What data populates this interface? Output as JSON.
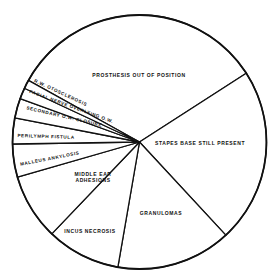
{
  "chart_data": {
    "type": "pie",
    "title": "",
    "center": [
      139.5,
      142
    ],
    "radius": 127,
    "start_angle_deg": 209,
    "categories": [
      "PROSTHESIS OUT OF POSITION",
      "STAPES BASE STILL PRESENT",
      "GRANULOMAS",
      "INCUS NECROSIS",
      "MIDDLE EAR ADHESIONS",
      "MALLEUS ANKYLOSIS",
      "PERILYMPH FISTULA",
      "SECONDARY O.W. CLOSURE",
      "FACIAL NERVE OVERLYING O.W.",
      "R.W. OTOSCLEROSIS"
    ],
    "values": [
      32.8,
      22.2,
      14.6,
      9.4,
      8.4,
      4.2,
      3.3,
      2.5,
      1.4,
      1.1
    ],
    "unit": "percent (estimated from slice angles)",
    "label_positions": [
      {
        "x": 139,
        "y": 77,
        "rot": 0,
        "lines": [
          "PROSTHESIS OUT OF POSITION"
        ]
      },
      {
        "x": 200,
        "y": 145,
        "rot": 0,
        "lines": [
          "STAPES BASE STILL PRESENT"
        ]
      },
      {
        "x": 161,
        "y": 215,
        "rot": 0,
        "lines": [
          "GRANULOMAS"
        ]
      },
      {
        "x": 90,
        "y": 233,
        "rot": 0,
        "lines": [
          "INCUS NECROSIS"
        ]
      },
      {
        "x": 93,
        "y": 176,
        "rot": 0,
        "lines": [
          "MIDDLE EAR",
          "ADHESIONS"
        ]
      },
      {
        "x": 50,
        "y": 160,
        "rot": -11,
        "lines": [
          "MALLEUS ANKYLOSIS"
        ]
      },
      {
        "x": 46,
        "y": 138,
        "rot": 2,
        "lines": [
          "PERILYMPH FISTULA"
        ]
      },
      {
        "x": 64,
        "y": 118,
        "rot": 13,
        "lines": [
          "SECONDARY O.W. CLOSURE"
        ]
      },
      {
        "x": 71,
        "y": 108,
        "rot": 20,
        "lines": [
          "FACIAL NERVE OVERLYING O.W."
        ]
      },
      {
        "x": 60,
        "y": 94,
        "rot": 25,
        "lines": [
          "R.W. OTOSCLEROSIS"
        ]
      }
    ],
    "legend": "none",
    "grid": false
  },
  "colors": {
    "background": "#ffffff",
    "stroke": "#111111",
    "fill": "#ffffff"
  }
}
